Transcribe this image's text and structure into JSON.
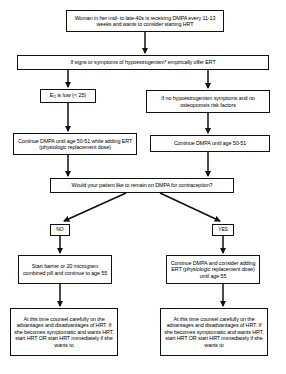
{
  "diagram": {
    "type": "flowchart",
    "nodes": {
      "start": "Woman in her mid- to late-40s is receiving DMPA every 11-13 weeks and wants to consider starting HRT",
      "signs": "If signs or symptoms of hypoestrogenism* empirically offer ERT",
      "e2_low_prefix": "E",
      "e2_low_sub": "2",
      "e2_low_suffix": " is low (< 25)",
      "no_hypo": "If no hypoestrogenism symptoms and no osteoporosis risk factors",
      "continue_add_ert": "Continue DMPA until age 50-51 while adding ERT (physiologic replacement dose)",
      "continue_dmpa": "Continue DMPA until age 50-51",
      "ask_contraception": "Would your patient like to remain on DMPA for contraception?",
      "branch_no": "NO",
      "branch_yes": "YES",
      "barrier": "Start barrier or 20 microgram combined pill and continue to age 55",
      "continue_consider": "Continue DMPA and consider adding ERT (physiologic replacement dose) until age 55",
      "counsel_left": "At this time counsel carefully on the advantages and disadvantages of HRT. If she becomes symptomatic and wants HRT, start HRT OR start HRT immediately if she wants to",
      "counsel_right": "At this time counsel carefully on the advantages and disadvantages of HRT. If she becomes symptomatic and wants HRT, start HRT OR start HRT immediately if she wants to"
    },
    "colors": {
      "line": "#111111",
      "background": "#ffffff",
      "text": "#000000"
    }
  }
}
